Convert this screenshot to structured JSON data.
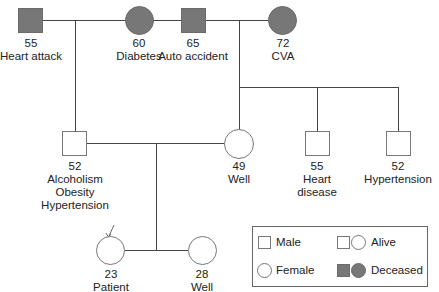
{
  "diagram": {
    "type": "pedigree",
    "generation1": {
      "paternal_grandfather": {
        "age": "55",
        "notes": [
          "Heart attack"
        ],
        "sex": "male",
        "status": "deceased"
      },
      "paternal_grandmother": {
        "age": "60",
        "notes": [
          "Diabetes"
        ],
        "sex": "female",
        "status": "deceased"
      },
      "maternal_grandfather": {
        "age": "65",
        "notes": [
          "Auto accident"
        ],
        "sex": "male",
        "status": "deceased"
      },
      "maternal_grandmother": {
        "age": "72",
        "notes": [
          "CVA"
        ],
        "sex": "female",
        "status": "deceased"
      }
    },
    "generation2": {
      "father": {
        "age": "52",
        "notes": [
          "Alcoholism",
          "Obesity",
          "Hypertension"
        ],
        "sex": "male",
        "status": "alive"
      },
      "mother": {
        "age": "49",
        "notes": [
          "Well"
        ],
        "sex": "female",
        "status": "alive"
      },
      "maternal_uncle_1": {
        "age": "55",
        "notes": [
          "Heart",
          "disease"
        ],
        "sex": "male",
        "status": "alive"
      },
      "maternal_uncle_2": {
        "age": "52",
        "notes": [
          "Hypertension"
        ],
        "sex": "male",
        "status": "alive"
      }
    },
    "generation3": {
      "patient": {
        "age": "23",
        "notes": [
          "Patient"
        ],
        "sex": "female",
        "status": "alive",
        "proband": true
      },
      "sister": {
        "age": "28",
        "notes": [
          "Well"
        ],
        "sex": "female",
        "status": "alive"
      }
    },
    "legend": {
      "male": "Male",
      "female": "Female",
      "alive": "Alive",
      "deceased": "Deceased"
    },
    "colors": {
      "deceased_fill": "#777777",
      "line": "#444444",
      "symbol_border": "#777777"
    }
  }
}
